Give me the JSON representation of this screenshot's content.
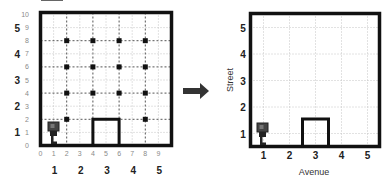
{
  "figure": {
    "arrow": "right-arrow"
  },
  "left_panel": {
    "fine_x_ticks": [
      "0",
      "1",
      "2",
      "3",
      "4",
      "5",
      "6",
      "7",
      "8",
      "9"
    ],
    "fine_y_ticks": [
      "0",
      "1",
      "2",
      "3",
      "4",
      "5",
      "6",
      "7",
      "8",
      "9",
      "10"
    ],
    "coarse_x_labels": [
      "1",
      "2",
      "3",
      "4",
      "5"
    ],
    "coarse_y_labels": [
      "1",
      "2",
      "3",
      "4",
      "5"
    ],
    "beepers": [
      [
        2,
        8
      ],
      [
        4,
        8
      ],
      [
        6,
        8
      ],
      [
        8,
        8
      ],
      [
        2,
        6
      ],
      [
        4,
        6
      ],
      [
        6,
        6
      ],
      [
        8,
        6
      ],
      [
        2,
        4
      ],
      [
        4,
        4
      ],
      [
        6,
        4
      ],
      [
        8,
        4
      ],
      [
        2,
        2
      ],
      [
        8,
        2
      ]
    ],
    "wall": {
      "x_from": 4,
      "x_to": 6,
      "height": 2
    },
    "robot": {
      "x": 1,
      "y": 1,
      "icon": "robot-icon"
    }
  },
  "right_panel": {
    "x_labels": [
      "1",
      "2",
      "3",
      "4",
      "5"
    ],
    "y_labels": [
      "1",
      "2",
      "3",
      "4",
      "5"
    ],
    "x_axis_title": "Avenue",
    "y_axis_title": "Street",
    "wall": {
      "avenue": 3,
      "height_streets": 1
    },
    "robot": {
      "avenue": 1,
      "street": 1,
      "icon": "robot-icon"
    }
  },
  "colors": {
    "wall": "#111111",
    "grid_dark": "#555555",
    "grid_light": "#bbbbbb",
    "robot": "#333333"
  }
}
